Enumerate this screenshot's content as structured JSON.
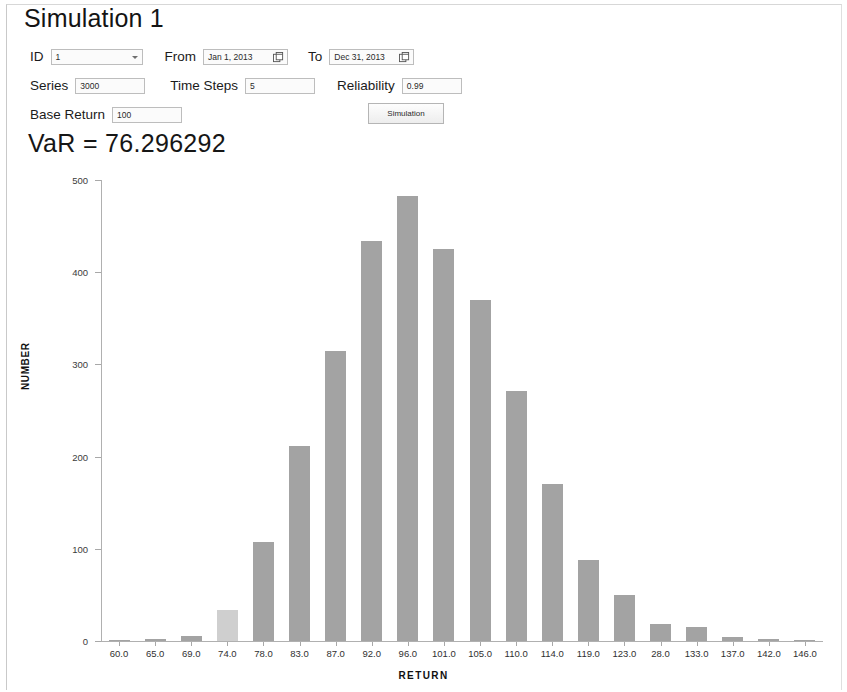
{
  "panel": {
    "title": "Simulation 1"
  },
  "form": {
    "id": {
      "label": "ID",
      "value": "1"
    },
    "from": {
      "label": "From",
      "value": "Jan 1, 2013",
      "icon": "calendar-icon"
    },
    "to": {
      "label": "To",
      "value": "Dec 31, 2013",
      "icon": "calendar-icon"
    },
    "series": {
      "label": "Series",
      "value": "3000"
    },
    "time_steps": {
      "label": "Time Steps",
      "value": "5"
    },
    "reliability": {
      "label": "Reliability",
      "value": "0.99"
    },
    "base_return": {
      "label": "Base Return",
      "value": "100"
    },
    "simulation_button": "Simulation"
  },
  "result": {
    "var_text": "VaR = 76.296292"
  },
  "colors": {
    "bar": "#a3a3a3",
    "bar_highlight": "#cfcfcf",
    "axis": "#b0b0b0",
    "text": "#1a1a1a"
  },
  "chart_data": {
    "type": "bar",
    "title": "",
    "xlabel": "RETURN",
    "ylabel": "NUMBER",
    "ylim": [
      0,
      500
    ],
    "yticks": [
      0,
      100,
      200,
      300,
      400,
      500
    ],
    "grid": false,
    "legend": false,
    "categories": [
      "60.0",
      "65.0",
      "69.0",
      "74.0",
      "78.0",
      "83.0",
      "87.0",
      "92.0",
      "96.0",
      "101.0",
      "105.0",
      "110.0",
      "114.0",
      "119.0",
      "123.0",
      "28.0",
      "133.0",
      "137.0",
      "142.0",
      "146.0"
    ],
    "values": [
      1,
      2,
      5,
      34,
      107,
      211,
      315,
      434,
      483,
      425,
      370,
      271,
      170,
      88,
      50,
      18,
      15,
      4,
      2,
      1
    ],
    "highlight_index": 3
  }
}
